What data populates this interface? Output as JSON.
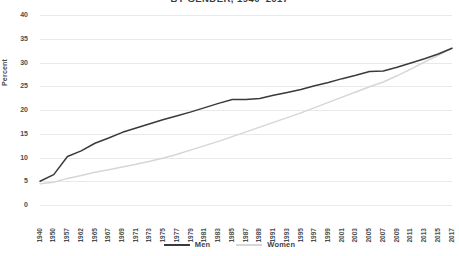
{
  "chart_data": {
    "type": "line",
    "title": "BY GENDER, 1940–2017",
    "xlabel": "",
    "ylabel": "Percent",
    "ylim": [
      0,
      40
    ],
    "ytick_step": 5,
    "grid": true,
    "legend_position": "bottom-center",
    "categories": [
      "1940",
      "1950",
      "1957",
      "1962",
      "1965",
      "1967",
      "1969",
      "1971",
      "1973",
      "1975",
      "1977",
      "1979",
      "1981",
      "1983",
      "1985",
      "1987",
      "1989",
      "1991",
      "1993",
      "1995",
      "1997",
      "1999",
      "2001",
      "2003",
      "2005",
      "2007",
      "2009",
      "2011",
      "2013",
      "2015",
      "2017"
    ],
    "y_tick_labels": [
      "0",
      "5",
      "10",
      "15",
      "20",
      "25",
      "30",
      "35",
      "40"
    ],
    "series": [
      {
        "name": "Men",
        "color": "#3a3a3a",
        "values": [
          5.0,
          6.4,
          10.2,
          11.4,
          13.0,
          14.1,
          15.3,
          16.2,
          17.1,
          18.0,
          18.8,
          19.6,
          20.5,
          21.4,
          22.2,
          22.2,
          22.4,
          23.1,
          23.7,
          24.3,
          25.1,
          25.8,
          26.6,
          27.3,
          28.1,
          28.2,
          29.0,
          29.9,
          30.8,
          31.8,
          33.0
        ]
      },
      {
        "name": "Women",
        "color": "#d6d6d6",
        "values": [
          4.5,
          4.8,
          5.6,
          6.2,
          6.9,
          7.4,
          8.0,
          8.6,
          9.2,
          9.9,
          10.7,
          11.6,
          12.5,
          13.4,
          14.4,
          15.4,
          16.4,
          17.4,
          18.4,
          19.4,
          20.5,
          21.6,
          22.7,
          23.8,
          24.9,
          25.9,
          27.2,
          28.6,
          30.1,
          31.5,
          33.0
        ]
      }
    ]
  },
  "legend": {
    "entries": [
      {
        "label": "Men",
        "color": "#3a3a3a"
      },
      {
        "label": "Women",
        "color": "#d6d6d6"
      }
    ]
  }
}
